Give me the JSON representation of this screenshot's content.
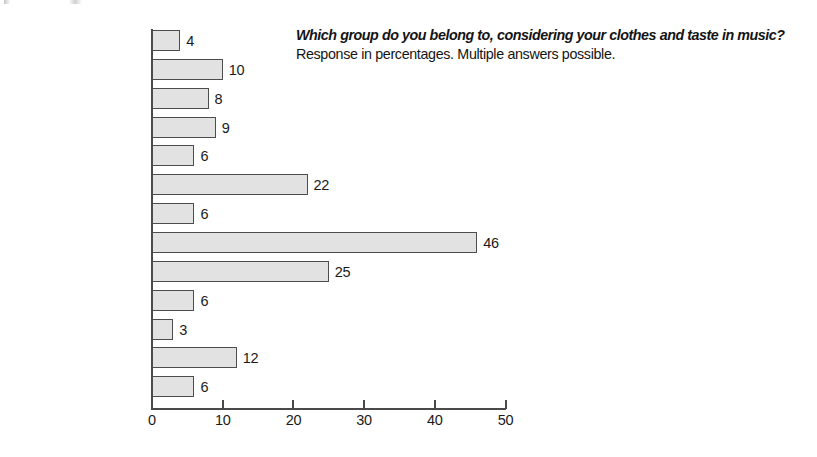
{
  "chart_data": {
    "type": "bar",
    "orientation": "horizontal",
    "title": "Which group do you belong to, considering your clothes and taste in music?",
    "subtitle": "Response in percentages. Multiple answers possible.",
    "xlabel": "",
    "ylabel": "",
    "xlim": [
      0,
      50
    ],
    "xticks": [
      0,
      10,
      20,
      30,
      40,
      50
    ],
    "xtick_labels": [
      "0",
      "10",
      "20",
      "30",
      "40",
      "50"
    ],
    "grid": false,
    "legend": null,
    "bar_fill_color": "#e2e2e2",
    "bar_edge_color": "#4d4d4d",
    "axis_color": "#4a4a4a",
    "background_color": "#ffffff",
    "categories": [
      "Gothic",
      "Skater",
      "Hip-hopper",
      "Snob",
      "Alto",
      "Trendy/Fashionista",
      "Gabber/Hardcore",
      "Average/Normal",
      "Top 40",
      "Punk",
      "Hippie",
      "R&B/Urban",
      "E-nerd/Gamer"
    ],
    "values": [
      4,
      10,
      8,
      9,
      6,
      22,
      6,
      46,
      25,
      6,
      3,
      12,
      6
    ],
    "value_labels": [
      "4",
      "10",
      "8",
      "9",
      "6",
      "22",
      "6",
      "46",
      "25",
      "6",
      "3",
      "12",
      "6"
    ]
  }
}
